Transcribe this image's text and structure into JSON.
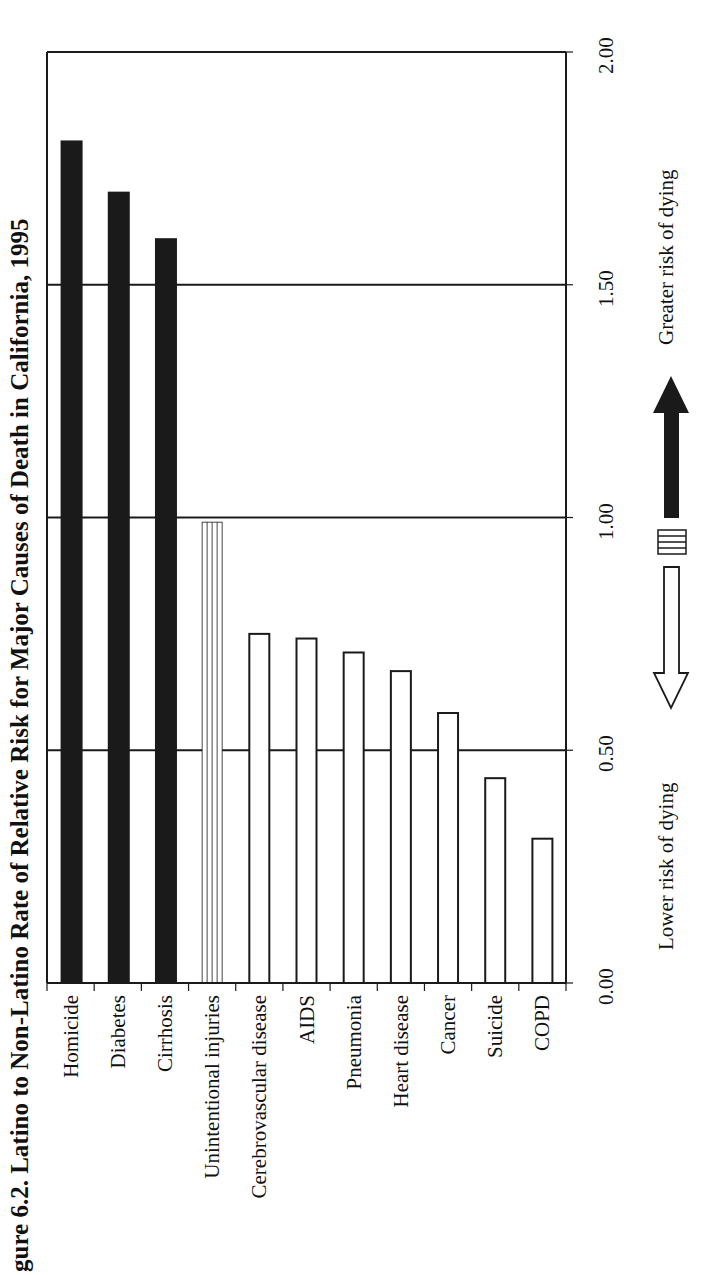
{
  "title": "gure 6.2. Latino to Non-Latino Rate of Relative Risk for Major Causes of Death in California, 1995",
  "legend": {
    "lower_label": "Lower risk of dying",
    "greater_label": "Greater risk of dying"
  },
  "colors": {
    "ink": "#1a1a1a",
    "background": "#ffffff"
  },
  "chart_data": {
    "type": "bar",
    "orientation": "rotated (bars rise from left baseline region; page rotated 90°)",
    "title": "Latino to Non-Latino Rate of Relative Risk for Major Causes of Death in California, 1995",
    "categories": [
      "Homicide",
      "Diabetes",
      "Cirrhosis",
      "Unintentional injuries",
      "Cerebrovascular disease",
      "AIDS",
      "Pneumonia",
      "Heart disease",
      "Cancer",
      "Suicide",
      "COPD"
    ],
    "values": [
      1.81,
      1.7,
      1.6,
      0.99,
      0.75,
      0.74,
      0.71,
      0.67,
      0.58,
      0.44,
      0.31
    ],
    "fills": [
      "solid",
      "solid",
      "solid",
      "striped",
      "outline",
      "outline",
      "outline",
      "outline",
      "outline",
      "outline",
      "outline"
    ],
    "ylabel": "Relative risk",
    "ylim": [
      0,
      2.0
    ],
    "yticks": [
      "0.00",
      "0.50",
      "1.00",
      "1.50",
      "2.00"
    ],
    "grid": true,
    "legend": [
      {
        "symbol": "solid arrow up",
        "label": "Greater risk of dying"
      },
      {
        "symbol": "striped box",
        "label": "About equal risk"
      },
      {
        "symbol": "outline arrow down",
        "label": "Lower risk of dying"
      }
    ]
  }
}
